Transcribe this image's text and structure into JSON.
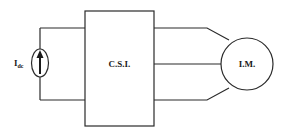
{
  "diagram": {
    "source": {
      "label": "I",
      "subscript": "dc",
      "type": "dc-current-source"
    },
    "inverter": {
      "label": "C.S.I."
    },
    "motor": {
      "label": "I.M."
    },
    "phases": 3,
    "colors": {
      "line": "#2a2a2a",
      "background": "#ffffff"
    }
  }
}
